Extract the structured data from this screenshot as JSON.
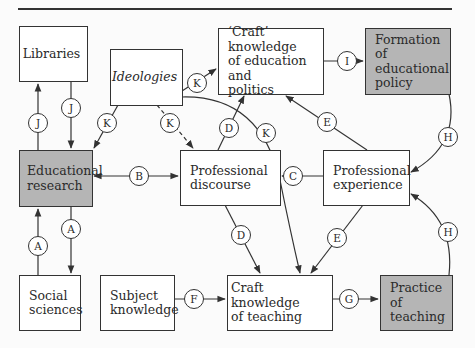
{
  "boxes": {
    "libraries": "Libraries",
    "ideologies": "Ideologies",
    "craft_politics": "‘Craft’ knowledge\nof education and\npolitics",
    "formation_policy": "Formation of\neducational\npolicy",
    "educational_research": "Educational\nresearch",
    "professional_discourse": "Professional\ndiscourse",
    "professional_experience": "Professional\nexperience",
    "social_sciences": "Social\nsciences",
    "subject_knowledge": "Subject\nknowledge",
    "craft_teaching": "Craft knowledge\nof teaching",
    "practice_teaching": "Practice of\nteaching"
  },
  "connectors": {
    "j_up": "J",
    "j_down": "J",
    "k_research": "K",
    "k_discourse": "K",
    "k_craft_politics": "K",
    "k_craft_teaching": "K",
    "a_up": "A",
    "a_down": "A",
    "b": "B",
    "c": "C",
    "d_up": "D",
    "d_down": "D",
    "e_up": "E",
    "e_down": "E",
    "f": "F",
    "g": "G",
    "h_down": "H",
    "h_up": "H",
    "i": "I"
  },
  "colors": {
    "highlight_fill": "#b5b5b5",
    "line": "#333333"
  }
}
